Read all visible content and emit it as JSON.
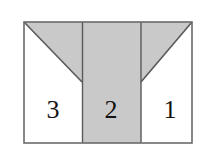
{
  "figure": {
    "kind": "geometry-diagram",
    "background_color": "#ffffff",
    "border_color": "#6b6b6b",
    "shade_color": "#c9c9c9",
    "unshaded_color": "#ffffff",
    "line_color": "#5a5a5a",
    "label_color": "#131313",
    "outer_rect": {
      "x": 24,
      "y": 22,
      "width": 168,
      "height": 121
    },
    "dividers": [
      {
        "name": "left-divider",
        "x": 82
      },
      {
        "name": "right-divider",
        "x": 141
      }
    ],
    "apex_y": 82,
    "panels": [
      {
        "name": "left-panel",
        "label": "3",
        "label_x": 53,
        "label_y": 118,
        "shaded": false,
        "shaded_region": "upper-triangle",
        "triangle_points": "24,22 82,22 82,82"
      },
      {
        "name": "middle-panel",
        "label": "2",
        "label_x": 111,
        "label_y": 118,
        "shaded": true,
        "shaded_region": "full",
        "rect": {
          "x": 82,
          "y": 22,
          "width": 59,
          "height": 121
        }
      },
      {
        "name": "right-panel",
        "label": "1",
        "label_x": 170,
        "label_y": 118,
        "shaded": false,
        "shaded_region": "upper-triangle",
        "triangle_points": "141,22 192,22 141,82"
      }
    ],
    "diagonals": [
      {
        "name": "left-diagonal",
        "x1": 24,
        "y1": 22,
        "x2": 82,
        "y2": 82
      },
      {
        "name": "right-diagonal",
        "x1": 192,
        "y1": 22,
        "x2": 141,
        "y2": 82
      }
    ]
  }
}
